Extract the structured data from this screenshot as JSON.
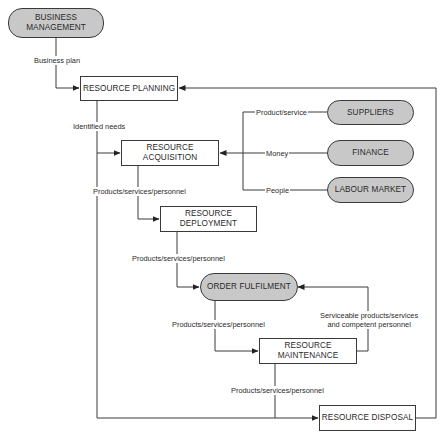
{
  "diagram": {
    "type": "flowchart",
    "colors": {
      "pill_fill": "#c8c8c8",
      "box_fill": "#ffffff",
      "stroke": "#3a3a3a"
    },
    "nodes": {
      "business_management": {
        "label": "BUSINESS MANAGEMENT",
        "line1": "BUSINESS",
        "line2": "MANAGEMENT",
        "shape": "pill"
      },
      "resource_planning": {
        "label": "RESOURCE PLANNING",
        "shape": "box"
      },
      "resource_acquisition": {
        "label": "RESOURCE ACQUISITION",
        "line1": "RESOURCE",
        "line2": "ACQUISITION",
        "shape": "box"
      },
      "suppliers": {
        "label": "SUPPLIERS",
        "shape": "pill"
      },
      "finance": {
        "label": "FINANCE",
        "shape": "pill"
      },
      "labour_market": {
        "label": "LABOUR MARKET",
        "shape": "pill"
      },
      "resource_deployment": {
        "label": "RESOURCE DEPLOYMENT",
        "line1": "RESOURCE",
        "line2": "DEPLOYMENT",
        "shape": "box"
      },
      "order_fulfilment": {
        "label": "ORDER FULFILMENT",
        "shape": "pill"
      },
      "resource_maintenance": {
        "label": "RESOURCE MAINTENANCE",
        "line1": "RESOURCE",
        "line2": "MAINTENANCE",
        "shape": "box"
      },
      "resource_disposal": {
        "label": "RESOURCE DISPOSAL",
        "shape": "box"
      }
    },
    "edge_labels": {
      "business_plan": "Business plan",
      "identified_needs": "Identified needs",
      "product_service": "Product/service",
      "money": "Money",
      "people": "People",
      "acq_to_deploy": "Products/services/personnel",
      "deploy_to_order": "Products/services/personnel",
      "order_to_maint": "Products/services/personnel",
      "maint_to_disposal": "Products/services/personnel",
      "maint_to_order_line1": "Serviceable products/services",
      "maint_to_order_line2": "and competent personnel"
    },
    "edges": [
      {
        "from": "BUSINESS MANAGEMENT",
        "to": "RESOURCE PLANNING",
        "label": "Business plan"
      },
      {
        "from": "RESOURCE PLANNING",
        "to": "RESOURCE ACQUISITION",
        "label": "Identified needs"
      },
      {
        "from": "RESOURCE PLANNING",
        "to": "RESOURCE DISPOSAL",
        "label": ""
      },
      {
        "from": "SUPPLIERS",
        "to": "RESOURCE ACQUISITION",
        "label": "Product/service"
      },
      {
        "from": "FINANCE",
        "to": "RESOURCE ACQUISITION",
        "label": "Money"
      },
      {
        "from": "LABOUR MARKET",
        "to": "RESOURCE ACQUISITION",
        "label": "People"
      },
      {
        "from": "RESOURCE ACQUISITION",
        "to": "RESOURCE DEPLOYMENT",
        "label": "Products/services/personnel"
      },
      {
        "from": "RESOURCE DEPLOYMENT",
        "to": "ORDER FULFILMENT",
        "label": "Products/services/personnel"
      },
      {
        "from": "ORDER FULFILMENT",
        "to": "RESOURCE MAINTENANCE",
        "label": "Products/services/personnel"
      },
      {
        "from": "RESOURCE MAINTENANCE",
        "to": "ORDER FULFILMENT",
        "label": "Serviceable products/services and competent personnel"
      },
      {
        "from": "RESOURCE MAINTENANCE",
        "to": "RESOURCE DISPOSAL",
        "label": "Products/services/personnel"
      },
      {
        "from": "RESOURCE DISPOSAL",
        "to": "RESOURCE PLANNING",
        "label": ""
      }
    ]
  }
}
